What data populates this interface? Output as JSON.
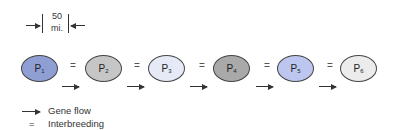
{
  "scale": {
    "value": "50",
    "unit": "mi."
  },
  "populations": [
    {
      "label": "P",
      "sub": "1",
      "fill": "#8f9fd4"
    },
    {
      "label": "P",
      "sub": "2",
      "fill": "#c6c6c6"
    },
    {
      "label": "P",
      "sub": "3",
      "fill": "#e6eaf7"
    },
    {
      "label": "P",
      "sub": "4",
      "fill": "#a9a9a9"
    },
    {
      "label": "P",
      "sub": "5",
      "fill": "#bcc6ee"
    },
    {
      "label": "P",
      "sub": "6",
      "fill": "#ececec"
    }
  ],
  "connector_symbol": "=",
  "legend": {
    "gene_flow": "Gene flow",
    "interbreeding_symbol": "=",
    "interbreeding": "Interbreeding"
  }
}
